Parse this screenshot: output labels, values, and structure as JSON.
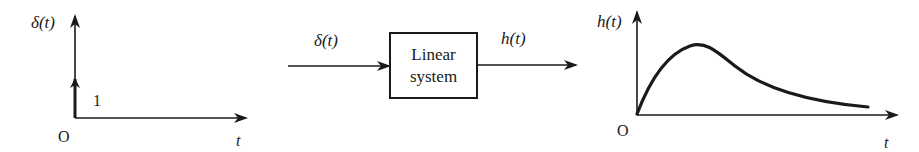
{
  "diagram": {
    "input_plot": {
      "y_label": "δ(t)",
      "x_label": "t",
      "origin_label": "O",
      "impulse_label": "1"
    },
    "block": {
      "input_label": "δ(t)",
      "line1": "Linear",
      "line2": "system",
      "output_label": "h(t)"
    },
    "output_plot": {
      "y_label": "h(t)",
      "x_label": "t",
      "origin_label": "O"
    },
    "colors": {
      "ink": "#1a1a1a",
      "background": "#ffffff"
    }
  }
}
